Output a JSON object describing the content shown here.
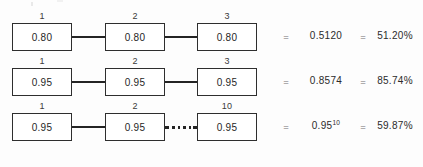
{
  "diagram": {
    "title_text": "",
    "colors": {
      "box_border": "#2e2e2e",
      "connector": "#242424",
      "text": "#2b2b2b",
      "equals_sign": "#6f6f6f",
      "background": "#fdfdfd"
    },
    "equals_symbol": "=",
    "rows": [
      {
        "id": "row-1",
        "connector_type": "solid",
        "steps": [
          {
            "index_label": "1",
            "value": "0.80"
          },
          {
            "index_label": "2",
            "value": "0.80"
          },
          {
            "index_label": "3",
            "value": "0.80"
          }
        ],
        "result_value": "0.5120",
        "result_value_base": "0.5120",
        "result_value_exponent": "",
        "result_percent": "51.20%"
      },
      {
        "id": "row-2",
        "connector_type": "solid",
        "steps": [
          {
            "index_label": "1",
            "value": "0.95"
          },
          {
            "index_label": "2",
            "value": "0.95"
          },
          {
            "index_label": "3",
            "value": "0.95"
          }
        ],
        "result_value": "0.8574",
        "result_value_base": "0.8574",
        "result_value_exponent": "",
        "result_percent": "85.74%"
      },
      {
        "id": "row-3",
        "connector_type": "dotted",
        "steps": [
          {
            "index_label": "1",
            "value": "0.95"
          },
          {
            "index_label": "2",
            "value": "0.95"
          },
          {
            "index_label": "10",
            "value": "0.95"
          }
        ],
        "result_value": "0.95^10",
        "result_value_base": "0.95",
        "result_value_exponent": "10",
        "result_percent": "59.87%"
      }
    ]
  }
}
